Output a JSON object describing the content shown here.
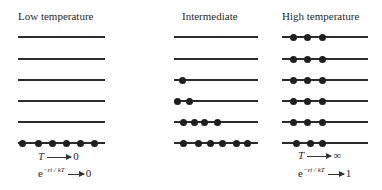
{
  "panels": [
    {
      "title": "Low temperature",
      "levels_dots_top_to_bottom": [
        0,
        0,
        0,
        0,
        0,
        6
      ],
      "limit_T": {
        "variable": "T",
        "arrow": "→",
        "value": "0"
      },
      "limit_boltzmann": {
        "base": "e",
        "exponent": "−ε_i / kT",
        "arrow": "→",
        "value": "0"
      }
    },
    {
      "title": "Intermediate",
      "levels_dots_top_to_bottom": [
        0,
        0,
        1,
        2,
        4,
        6
      ]
    },
    {
      "title": "High temperature",
      "levels_dots_top_to_bottom": [
        3,
        3,
        3,
        3,
        3,
        3
      ],
      "limit_T": {
        "variable": "T",
        "arrow": "→",
        "value": "∞"
      },
      "limit_boltzmann": {
        "base": "e",
        "exponent": "−ε_i / kT",
        "arrow": "→",
        "value": "1"
      }
    }
  ],
  "labels": {
    "low_T_var": "T",
    "low_T_value": "0",
    "low_exp_base": "e",
    "low_exp_sup": "−εi / kT",
    "low_exp_value": "0",
    "high_T_var": "T",
    "high_T_value": "∞",
    "high_exp_base": "e",
    "high_exp_sup": "−εi / kT",
    "high_exp_value": "1"
  }
}
